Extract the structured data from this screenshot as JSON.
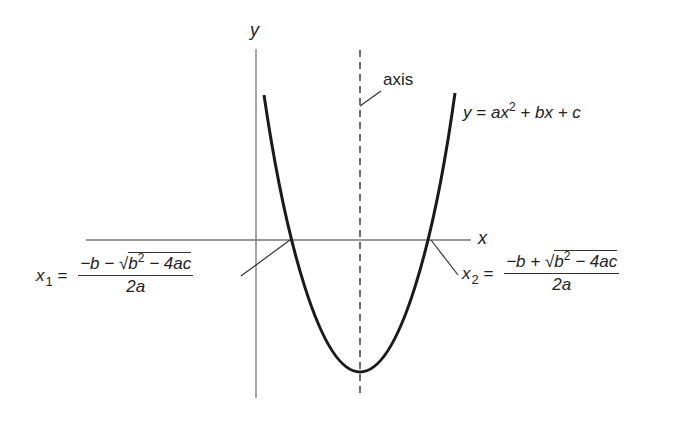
{
  "diagram": {
    "axes": {
      "x_label": "x",
      "y_label": "y"
    },
    "axis_of_symmetry_label": "axis",
    "curve_equation": {
      "lhs": "y",
      "eq": "=",
      "a": "a",
      "x": "x",
      "exp": "2",
      "rest": "+ bx + c"
    },
    "root1": {
      "var": "x",
      "sub": "1",
      "eq": "=",
      "numerator_pre": "−b −",
      "radicand_b": "b",
      "radicand_exp": "2",
      "radicand_rest": "− 4ac",
      "denominator": "2a"
    },
    "root2": {
      "var": "x",
      "sub": "2",
      "eq": "=",
      "numerator_pre": "−b +",
      "radicand_b": "b",
      "radicand_exp": "2",
      "radicand_rest": "− 4ac",
      "denominator": "2a"
    },
    "colors": {
      "curve": "#1a1a1a",
      "axes": "#777777",
      "dashed_axis": "#333333",
      "text": "#222222"
    }
  }
}
